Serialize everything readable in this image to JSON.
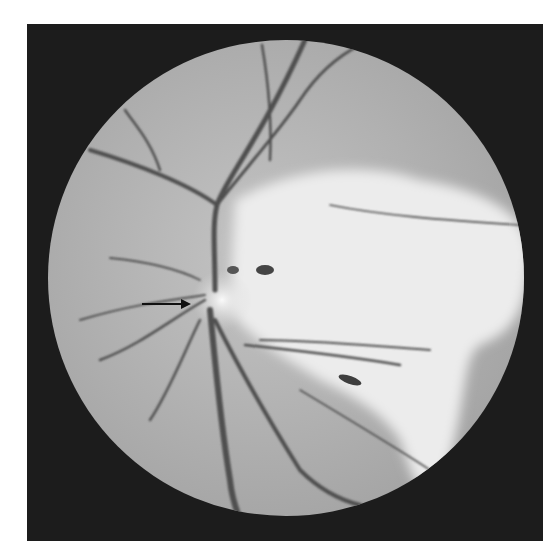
{
  "figure": {
    "annotation": {
      "type": "arrow",
      "points_to": "optic disc",
      "color": "#111111"
    },
    "colors": {
      "background": "#ffffff",
      "frame": "#1c1c1c",
      "fundus": "#b4b4b4",
      "vessel": "#4a4a4a",
      "bright_region": "#eeeeee"
    }
  }
}
